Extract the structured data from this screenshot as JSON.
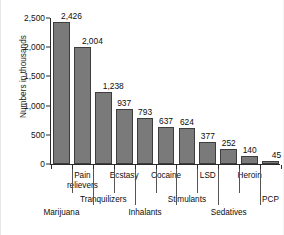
{
  "chart_data": {
    "type": "bar",
    "title": "",
    "xlabel": "",
    "ylabel": "Numbers in thousands",
    "ylim": [
      0,
      2500
    ],
    "grid": false,
    "legend": "none",
    "y_ticks": [
      0,
      500,
      1000,
      1500,
      2000,
      2500
    ],
    "y_tick_labels": [
      "0",
      "500",
      "1,000",
      "1,500",
      "2,000",
      "2,500"
    ],
    "categories": [
      "Marijuana",
      "Pain relievers",
      "Tranquilizers",
      "Ecstasy",
      "Inhalants",
      "Cocaine",
      "Stimulants",
      "LSD",
      "Sedatives",
      "Heroin",
      "PCP"
    ],
    "values": [
      2426,
      2004,
      1238,
      937,
      793,
      637,
      624,
      377,
      252,
      140,
      45
    ],
    "value_labels": [
      "2,426",
      "2,004",
      "1,238",
      "937",
      "793",
      "637",
      "624",
      "377",
      "252",
      "140",
      "45"
    ],
    "bar_color": "#7a7a7a",
    "bar_edge_color": "#3d3d3d",
    "axis_color": "#2b2b2b"
  },
  "axis": {
    "y_title": "Numbers in thousands"
  },
  "tier1": [
    {
      "text": "Pain\nrelievers",
      "line1": "Pain",
      "line2": "relievers"
    },
    {
      "text": "Ecstasy"
    },
    {
      "text": "Cocaine"
    },
    {
      "text": "LSD"
    },
    {
      "text": "Heroin"
    }
  ],
  "tier_labels": {
    "pain_line1": "Pain",
    "pain_line2": "relievers",
    "ecstasy": "Ecstasy",
    "cocaine": "Cocaine",
    "lsd": "LSD",
    "heroin": "Heroin",
    "tranquilizers": "Tranquilizers",
    "stimulants": "Stimulants",
    "pcp": "PCP",
    "marijuana": "Marijuana",
    "inhalants": "Inhalants",
    "sedatives": "Sedatives"
  }
}
